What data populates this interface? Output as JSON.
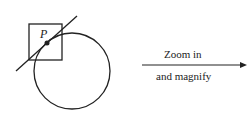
{
  "diagram": {
    "point_label": "P",
    "arrow_label_top": "Zoom in",
    "arrow_label_bottom": "and magnify",
    "colors": {
      "stroke": "#222222",
      "background": "#ffffff"
    }
  }
}
